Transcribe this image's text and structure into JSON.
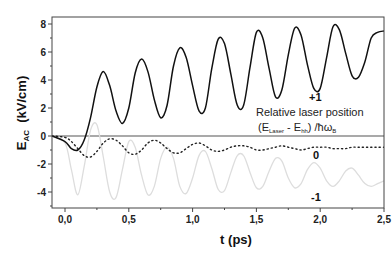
{
  "chart_data": {
    "type": "line",
    "title": "",
    "xlabel": "t   (ps)",
    "ylabel": "E_AC  (kV/cm)",
    "ylabel_main": "E",
    "ylabel_sub": "AC",
    "ylabel_units": "(kV/cm)",
    "xlim": [
      -0.1,
      2.5
    ],
    "ylim": [
      -5,
      8.8
    ],
    "x_ticks": [
      0.0,
      0.5,
      1.0,
      1.5,
      2.0,
      2.5
    ],
    "x_tick_labels": [
      "0,0",
      "0,5",
      "1,0",
      "1,5",
      "2,0",
      "2,5"
    ],
    "y_ticks": [
      -4,
      -2,
      0,
      2,
      4,
      6,
      8
    ],
    "y_tick_labels": [
      "-4",
      "-2",
      "0",
      "2",
      "4",
      "6",
      "8"
    ],
    "grid": false,
    "zero_line": true,
    "legend": {
      "title_line1": "Relative laser position",
      "title_line2_parts": [
        "(E",
        "Laser",
        " - E",
        "hh",
        ") /ħω",
        "B"
      ]
    },
    "series": [
      {
        "name": "+1",
        "style": "solid",
        "color": "#111111",
        "x": [
          -0.1,
          0.0,
          0.05,
          0.1,
          0.15,
          0.2,
          0.25,
          0.3,
          0.35,
          0.4,
          0.45,
          0.5,
          0.55,
          0.6,
          0.65,
          0.7,
          0.75,
          0.8,
          0.85,
          0.9,
          0.95,
          1.0,
          1.05,
          1.1,
          1.15,
          1.2,
          1.25,
          1.3,
          1.35,
          1.4,
          1.45,
          1.5,
          1.55,
          1.6,
          1.65,
          1.7,
          1.75,
          1.8,
          1.85,
          1.9,
          1.95,
          2.0,
          2.05,
          2.1,
          2.15,
          2.2,
          2.25,
          2.3,
          2.35,
          2.4,
          2.45,
          2.5
        ],
        "y": [
          0.0,
          -0.4,
          -0.9,
          -1.0,
          -0.3,
          1.3,
          3.5,
          4.6,
          3.6,
          1.8,
          0.9,
          2.0,
          4.5,
          5.5,
          4.6,
          2.6,
          1.3,
          2.2,
          5.0,
          6.3,
          5.6,
          3.6,
          1.8,
          2.0,
          4.8,
          6.9,
          6.6,
          4.4,
          2.2,
          2.2,
          4.9,
          7.4,
          7.0,
          4.8,
          2.8,
          3.3,
          5.8,
          7.7,
          7.2,
          5.1,
          3.4,
          3.4,
          5.6,
          7.8,
          7.6,
          5.9,
          4.3,
          4.2,
          5.3,
          7.0,
          7.4,
          7.5
        ]
      },
      {
        "name": "0",
        "style": "dotted",
        "color": "#222222",
        "x": [
          -0.1,
          0.0,
          0.05,
          0.1,
          0.15,
          0.2,
          0.25,
          0.3,
          0.35,
          0.4,
          0.45,
          0.5,
          0.55,
          0.6,
          0.65,
          0.7,
          0.75,
          0.8,
          0.85,
          0.9,
          0.95,
          1.0,
          1.05,
          1.1,
          1.15,
          1.2,
          1.25,
          1.3,
          1.35,
          1.4,
          1.45,
          1.5,
          1.55,
          1.6,
          1.65,
          1.7,
          1.75,
          1.8,
          1.85,
          1.9,
          1.95,
          2.0,
          2.05,
          2.1,
          2.15,
          2.2,
          2.25,
          2.3,
          2.35,
          2.4,
          2.45,
          2.5
        ],
        "y": [
          0.0,
          -0.1,
          -0.4,
          -0.9,
          -1.4,
          -1.5,
          -1.1,
          -0.5,
          -0.2,
          -0.3,
          -0.7,
          -1.2,
          -1.3,
          -1.0,
          -0.5,
          -0.3,
          -0.5,
          -0.9,
          -1.2,
          -1.2,
          -0.9,
          -0.6,
          -0.5,
          -0.7,
          -1.0,
          -1.1,
          -1.0,
          -0.8,
          -0.7,
          -0.7,
          -0.8,
          -1.0,
          -1.0,
          -0.9,
          -0.8,
          -0.7,
          -0.8,
          -0.9,
          -1.0,
          -0.9,
          -0.8,
          -0.8,
          -0.8,
          -0.9,
          -0.9,
          -0.9,
          -0.8,
          -0.8,
          -0.8,
          -0.8,
          -0.8,
          -0.8
        ]
      },
      {
        "name": "-1",
        "style": "solid-light",
        "color": "#dddddd",
        "x": [
          -0.1,
          0.0,
          0.05,
          0.1,
          0.15,
          0.2,
          0.25,
          0.3,
          0.35,
          0.4,
          0.45,
          0.5,
          0.55,
          0.6,
          0.65,
          0.7,
          0.75,
          0.8,
          0.85,
          0.9,
          0.95,
          1.0,
          1.05,
          1.1,
          1.15,
          1.2,
          1.25,
          1.3,
          1.35,
          1.4,
          1.45,
          1.5,
          1.55,
          1.6,
          1.65,
          1.7,
          1.75,
          1.8,
          1.85,
          1.9,
          1.95,
          2.0,
          2.05,
          2.1,
          2.15,
          2.2,
          2.25,
          2.3,
          2.35,
          2.4,
          2.45,
          2.5
        ],
        "y": [
          0.0,
          -0.5,
          -2.4,
          -4.2,
          -2.2,
          0.4,
          0.8,
          -1.5,
          -4.0,
          -4.4,
          -2.4,
          -0.4,
          -0.8,
          -2.8,
          -4.2,
          -3.6,
          -1.6,
          -0.8,
          -1.6,
          -3.6,
          -4.1,
          -3.0,
          -1.4,
          -1.1,
          -2.3,
          -3.8,
          -3.9,
          -2.6,
          -1.4,
          -1.4,
          -2.6,
          -3.7,
          -3.6,
          -2.5,
          -1.6,
          -1.8,
          -3.0,
          -3.7,
          -3.4,
          -2.4,
          -1.9,
          -2.3,
          -3.2,
          -3.6,
          -3.2,
          -2.5,
          -2.3,
          -2.8,
          -3.4,
          -3.6,
          -3.4,
          -3.2
        ]
      }
    ]
  }
}
